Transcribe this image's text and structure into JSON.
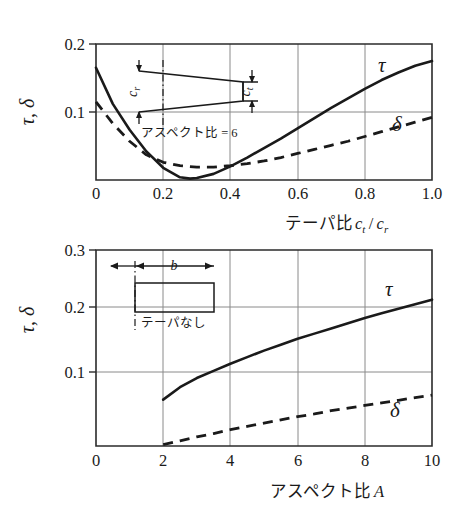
{
  "figure": {
    "background_color": "#ffffff",
    "ink_color": "#1a1a1a",
    "grid_color": "#8a8a8a"
  },
  "chart_data": [
    {
      "type": "line",
      "id": "taper-ratio-chart",
      "title": "",
      "xlabel": "テーパ比 c_t / c_r",
      "ylabel": "τ, δ",
      "xlim": [
        0,
        1.0
      ],
      "ylim": [
        0,
        0.2
      ],
      "xticks": [
        "0",
        "0.2",
        "0.4",
        "0.6",
        "0.8",
        "1.0"
      ],
      "xtick_values": [
        0,
        0.2,
        0.4,
        0.6,
        0.8,
        1.0
      ],
      "yticks": [
        "0.1",
        "0.2"
      ],
      "ytick_values": [
        0.1,
        0.2
      ],
      "grid": true,
      "legend_position": "inline-annotation",
      "series": [
        {
          "name": "τ",
          "style": "solid",
          "x": [
            0.0,
            0.05,
            0.1,
            0.15,
            0.2,
            0.25,
            0.28,
            0.3,
            0.35,
            0.4,
            0.45,
            0.5,
            0.55,
            0.6,
            0.65,
            0.7,
            0.75,
            0.8,
            0.85,
            0.9,
            0.95,
            1.0
          ],
          "values": [
            0.165,
            0.112,
            0.074,
            0.042,
            0.018,
            0.004,
            0.002,
            0.003,
            0.009,
            0.02,
            0.033,
            0.047,
            0.061,
            0.076,
            0.091,
            0.106,
            0.12,
            0.134,
            0.147,
            0.158,
            0.168,
            0.175
          ]
        },
        {
          "name": "δ",
          "style": "dashed",
          "x": [
            0.0,
            0.05,
            0.1,
            0.15,
            0.2,
            0.25,
            0.3,
            0.35,
            0.4,
            0.45,
            0.5,
            0.55,
            0.6,
            0.65,
            0.7,
            0.75,
            0.8,
            0.85,
            0.9,
            0.95,
            1.0
          ],
          "values": [
            0.115,
            0.083,
            0.057,
            0.037,
            0.026,
            0.021,
            0.019,
            0.019,
            0.021,
            0.024,
            0.028,
            0.033,
            0.039,
            0.045,
            0.051,
            0.057,
            0.064,
            0.071,
            0.078,
            0.085,
            0.092
          ]
        }
      ],
      "inset": {
        "caption": "アスペクト比 = 6",
        "root_chord_label": "c_r",
        "tip_chord_label": "c_t",
        "shape": "tapered-wing"
      }
    },
    {
      "type": "line",
      "id": "aspect-ratio-chart",
      "title": "",
      "xlabel": "アスペクト比 A",
      "ylabel": "τ, δ",
      "xlim": [
        0,
        10
      ],
      "ylim": [
        0,
        0.3
      ],
      "xticks": [
        "0",
        "2",
        "4",
        "6",
        "8",
        "10"
      ],
      "xtick_values": [
        0,
        2,
        4,
        6,
        8,
        10
      ],
      "yticks": [
        "0.1",
        "0.2",
        "0.3"
      ],
      "ytick_values": [
        0.1,
        0.2,
        0.3
      ],
      "grid": true,
      "legend_position": "inline-annotation",
      "series": [
        {
          "name": "τ",
          "style": "solid",
          "x": [
            2,
            2.5,
            3,
            3.5,
            4,
            4.5,
            5,
            5.5,
            6,
            6.5,
            7,
            7.5,
            8,
            8.5,
            9,
            9.5,
            10
          ],
          "values": [
            0.071,
            0.09,
            0.104,
            0.115,
            0.126,
            0.136,
            0.146,
            0.155,
            0.164,
            0.172,
            0.18,
            0.188,
            0.196,
            0.203,
            0.21,
            0.217,
            0.224
          ]
        },
        {
          "name": "δ",
          "style": "dashed",
          "x": [
            2,
            2.5,
            3,
            3.5,
            4,
            4.5,
            5,
            5.5,
            6,
            6.5,
            7,
            7.5,
            8,
            8.5,
            9,
            9.5,
            10
          ],
          "values": [
            0.002,
            0.008,
            0.014,
            0.019,
            0.025,
            0.03,
            0.035,
            0.04,
            0.045,
            0.049,
            0.054,
            0.058,
            0.062,
            0.066,
            0.07,
            0.074,
            0.078
          ]
        }
      ],
      "inset": {
        "caption": "テーパなし",
        "span_label": "b",
        "shape": "rectangular-wing"
      }
    }
  ],
  "labels": {
    "top": {
      "y_axis_title": "τ, δ",
      "x_axis_title_jp": "テーパ比",
      "x_axis_title_sym_num": "c",
      "x_axis_title_sub_num": "t",
      "x_axis_title_slash": "/",
      "x_axis_title_sym_den": "c",
      "x_axis_title_sub_den": "r",
      "tick_x_0": "0",
      "tick_x_1": "0.2",
      "tick_x_2": "0.4",
      "tick_x_3": "0.6",
      "tick_x_4": "0.8",
      "tick_x_5": "1.0",
      "tick_y_0": "0.1",
      "tick_y_1": "0.2",
      "curve_tau": "τ",
      "curve_delta": "δ",
      "inset_caption": "アスペクト比 = 6",
      "inset_cr": "c",
      "inset_cr_sub": "r",
      "inset_ct": "c",
      "inset_ct_sub": "t"
    },
    "bottom": {
      "y_axis_title": "τ, δ",
      "x_axis_title_jp": "アスペクト比",
      "x_axis_title_sym": "A",
      "tick_x_0": "0",
      "tick_x_1": "2",
      "tick_x_2": "4",
      "tick_x_3": "6",
      "tick_x_4": "8",
      "tick_x_5": "10",
      "tick_y_0": "0.1",
      "tick_y_1": "0.2",
      "tick_y_2": "0.3",
      "curve_tau": "τ",
      "curve_delta": "δ",
      "inset_caption": "テーパなし",
      "inset_b": "b"
    }
  }
}
